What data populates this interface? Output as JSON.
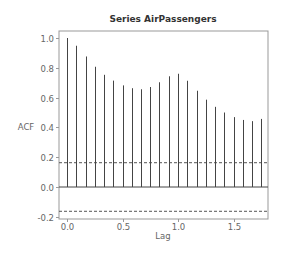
{
  "chart_data": {
    "type": "bar",
    "subtype": "acf-stem",
    "title": "Series AirPassengers",
    "xlabel": "Lag",
    "ylabel": "ACF",
    "x": [
      0.0,
      0.0833,
      0.1667,
      0.25,
      0.3333,
      0.4167,
      0.5,
      0.5833,
      0.6667,
      0.75,
      0.8333,
      0.9167,
      1.0,
      1.0833,
      1.1667,
      1.25,
      1.3333,
      1.4167,
      1.5,
      1.5833,
      1.6667,
      1.75
    ],
    "values": [
      1.0,
      0.948,
      0.876,
      0.807,
      0.753,
      0.714,
      0.682,
      0.663,
      0.656,
      0.671,
      0.703,
      0.743,
      0.76,
      0.713,
      0.646,
      0.586,
      0.538,
      0.5,
      0.469,
      0.45,
      0.442,
      0.457
    ],
    "confidence_bounds": [
      0.163,
      -0.163
    ],
    "xlim": [
      -0.07,
      1.83
    ],
    "ylim": [
      -0.21,
      1.05
    ],
    "xticks": [
      "0.0",
      "0.5",
      "1.0",
      "1.5"
    ],
    "xtick_values": [
      0.0,
      0.5,
      1.0,
      1.5
    ],
    "yticks": [
      "-0.2",
      "0.0",
      "0.2",
      "0.4",
      "0.6",
      "0.8",
      "1.0"
    ],
    "ytick_values": [
      -0.2,
      0.0,
      0.2,
      0.4,
      0.6,
      0.8,
      1.0
    ],
    "grid": false,
    "legend": null,
    "colors": {
      "bars": "#444444",
      "zero_line": "#444444",
      "bounds": "#555555",
      "frame": "#999999",
      "text": "#666666",
      "title": "#333333"
    }
  }
}
